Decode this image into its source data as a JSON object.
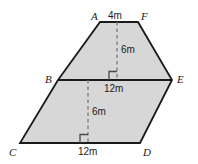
{
  "figure": {
    "type": "geometry-diagram",
    "fill_color": "#d7d7d7",
    "stroke_color": "#1a1a1a",
    "dash_color": "#7a7a7a",
    "background_color": "#ffffff",
    "vertices": [
      {
        "name": "A",
        "x": 100,
        "y": 22,
        "label": "A",
        "label_x": 91,
        "label_y": 11
      },
      {
        "name": "F",
        "x": 138,
        "y": 22,
        "label": "F",
        "label_x": 141,
        "label_y": 11
      },
      {
        "name": "E",
        "x": 172,
        "y": 80,
        "label": "E",
        "label_x": 177,
        "label_y": 74
      },
      {
        "name": "D",
        "x": 140,
        "y": 143,
        "label": "D",
        "label_x": 143,
        "label_y": 147
      },
      {
        "name": "C",
        "x": 20,
        "y": 143,
        "label": "C",
        "label_x": 9,
        "label_y": 147
      },
      {
        "name": "B",
        "x": 58,
        "y": 80,
        "label": "B",
        "label_x": 45,
        "label_y": 74
      }
    ],
    "divider": {
      "from": "B",
      "to": "E"
    },
    "dimensions": [
      {
        "name": "top-edge",
        "value": "4m",
        "label_x": 108,
        "label_y": 11
      },
      {
        "name": "upper-height",
        "value": "6m",
        "label_x": 121,
        "label_y": 45
      },
      {
        "name": "middle-edge",
        "value": "12m",
        "label_x": 104,
        "label_y": 84
      },
      {
        "name": "lower-height",
        "value": "6m",
        "label_x": 92,
        "label_y": 107
      },
      {
        "name": "bottom-edge",
        "value": "12m",
        "label_x": 78,
        "label_y": 147
      }
    ],
    "height_markers": [
      {
        "name": "upper-height-line",
        "x": 117,
        "y_top": 22,
        "y_bottom": 80
      },
      {
        "name": "lower-height-line",
        "x": 88,
        "y_top": 80,
        "y_bottom": 143
      }
    ],
    "right_angle_marks": [
      {
        "name": "upper-right-angle",
        "x": 110,
        "y": 72,
        "size": 8
      },
      {
        "name": "lower-right-angle",
        "x": 81,
        "y": 135,
        "size": 8
      }
    ]
  }
}
